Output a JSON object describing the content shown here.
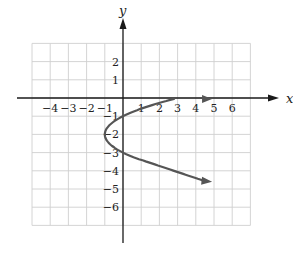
{
  "chart_data": {
    "type": "line",
    "title": "",
    "xlabel": "x",
    "ylabel": "y",
    "xlim": [
      -5,
      7
    ],
    "ylim": [
      -7,
      3.5
    ],
    "grid": true,
    "x_ticks": [
      -4,
      -3,
      -2,
      -1,
      1,
      2,
      3,
      4,
      5,
      6
    ],
    "y_ticks": [
      2,
      1,
      -1,
      -2,
      -3,
      -4,
      -5,
      -6
    ],
    "x_tick_labels": [
      "−4",
      "−3",
      "−2",
      "−1",
      "1",
      "2",
      "3",
      "4",
      "5",
      "6"
    ],
    "y_tick_labels": [
      "2",
      "1",
      "−1",
      "−2",
      "−3",
      "−4",
      "−5",
      "−6"
    ],
    "series": [
      {
        "name": "x = (y + 2)^2 - 1",
        "description": "Parabola opening to the right, vertex at (-1, -2), arrows on both ends",
        "vertex": [
          -1,
          -2
        ],
        "points": [
          [
            4.6,
            0.0
          ],
          [
            3.0,
            -0.35
          ],
          [
            1.0,
            -0.6
          ],
          [
            0.0,
            -1.0
          ],
          [
            -0.75,
            -1.5
          ],
          [
            -1.0,
            -2.0
          ],
          [
            -0.75,
            -2.5
          ],
          [
            0.0,
            -3.0
          ],
          [
            1.0,
            -3.4
          ],
          [
            3.0,
            -4.1
          ],
          [
            4.5,
            -4.6
          ]
        ],
        "color": "#555555"
      }
    ]
  },
  "labels": {
    "x_axis": "x",
    "y_axis": "y"
  },
  "colors": {
    "grid": "#cfcfcf",
    "axis": "#1a1a1a",
    "curve": "#555555"
  }
}
